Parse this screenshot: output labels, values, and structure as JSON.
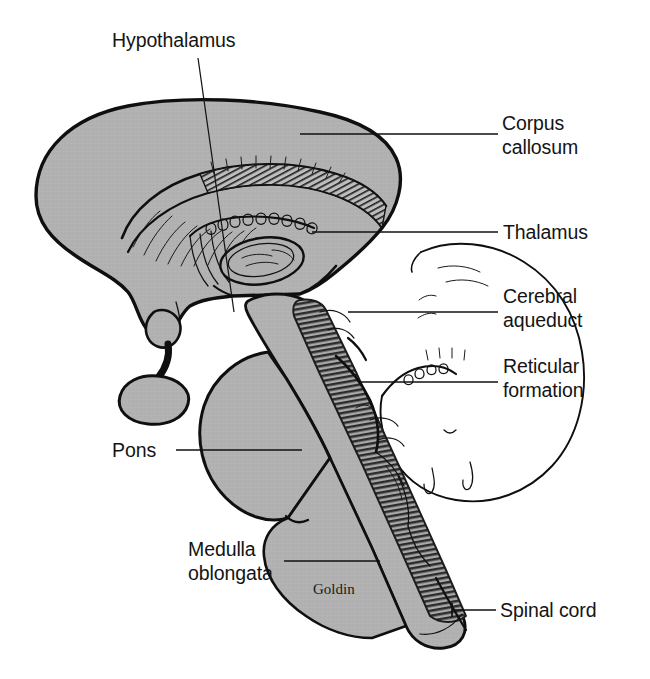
{
  "figure": {
    "signature": "Goldin",
    "background_color": "#ffffff",
    "tissue_fill_color": "#b3b3b3",
    "ink_color": "#111111"
  },
  "labels": [
    {
      "id": "hypothalamus",
      "text": "Hypothalamus",
      "side": "top",
      "text_x": 112,
      "text_y": 47,
      "anchor": "start"
    },
    {
      "id": "corpus-callosum",
      "text_line1": "Corpus",
      "text_line2": "callosum",
      "side": "right",
      "text_x": 502,
      "text_y": 130,
      "anchor": "start"
    },
    {
      "id": "thalamus",
      "text": "Thalamus",
      "side": "right",
      "text_x": 503,
      "text_y": 239,
      "anchor": "start"
    },
    {
      "id": "cerebral-aqueduct",
      "text_line1": "Cerebral",
      "text_line2": "aqueduct",
      "side": "right",
      "text_x": 503,
      "text_y": 303,
      "anchor": "start"
    },
    {
      "id": "reticular-formation",
      "text_line1": "Reticular",
      "text_line2": "formation",
      "side": "right",
      "text_x": 503,
      "text_y": 373,
      "anchor": "start"
    },
    {
      "id": "pons",
      "text": "Pons",
      "side": "left",
      "text_x": 112,
      "text_y": 457,
      "anchor": "start"
    },
    {
      "id": "medulla-oblongata",
      "text_line1": "Medulla",
      "text_line2": "oblongata",
      "side": "left",
      "text_x": 188,
      "text_y": 556,
      "anchor": "start"
    },
    {
      "id": "spinal-cord",
      "text": "Spinal cord",
      "side": "right",
      "text_x": 500,
      "text_y": 617,
      "anchor": "start"
    }
  ],
  "structures": [
    {
      "id": "cerebrum",
      "name": "Cerebrum"
    },
    {
      "id": "corpus-callosum-body",
      "name": "Corpus callosum"
    },
    {
      "id": "thalamus-body",
      "name": "Thalamus"
    },
    {
      "id": "hypothalamus-body",
      "name": "Hypothalamus"
    },
    {
      "id": "pituitary-gland",
      "name": "Pituitary gland"
    },
    {
      "id": "midbrain",
      "name": "Midbrain"
    },
    {
      "id": "pons-body",
      "name": "Pons"
    },
    {
      "id": "medulla-body",
      "name": "Medulla oblongata"
    },
    {
      "id": "reticular-formation-band",
      "name": "Reticular formation"
    },
    {
      "id": "cerebellum",
      "name": "Cerebellum"
    },
    {
      "id": "spinal-cord-body",
      "name": "Spinal cord"
    }
  ]
}
